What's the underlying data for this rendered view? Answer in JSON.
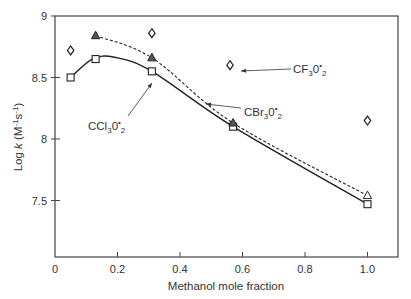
{
  "chart_data": {
    "type": "scatter",
    "title": "",
    "xlabel": "Methanol mole fraction",
    "ylabel": "Log k (M-1s-1)",
    "ylabel_parts": {
      "main": "Log ",
      "k": "k",
      "unit_open": " (M",
      "exp1": "-1",
      "mid": "s",
      "exp2": "-1",
      "unit_close": ")"
    },
    "xlim": [
      0,
      1.1
    ],
    "ylim": [
      7.04,
      9
    ],
    "xticks": [
      0,
      0.2,
      0.4,
      0.6,
      0.8,
      1.0
    ],
    "xtick_labels": [
      "0",
      "0.2",
      "0.4",
      "0.6",
      "0.8",
      "1.0"
    ],
    "yticks": [
      7.5,
      8,
      8.5,
      9
    ],
    "ytick_labels": [
      "7.5",
      "8",
      "8.5",
      "9"
    ],
    "grid": false,
    "legend": "inline annotations with arrows",
    "series": [
      {
        "name": "CCl3O2*",
        "label_main": "CCl",
        "label_sub": "3",
        "label_o": "0",
        "label_sup": "•",
        "label_sub2": "2",
        "marker": "open-square",
        "line": "solid",
        "x": [
          0.05,
          0.13,
          0.31,
          0.57,
          1.0
        ],
        "y": [
          8.5,
          8.65,
          8.55,
          8.1,
          7.47
        ]
      },
      {
        "name": "CBr3O2*",
        "label_main": "CBr",
        "label_sub": "3",
        "label_o": "0",
        "label_sup": "•",
        "label_sub2": "2",
        "marker": "triangle",
        "line": "dashed",
        "x": [
          0.13,
          0.31,
          0.57,
          1.0
        ],
        "y": [
          8.84,
          8.66,
          8.13,
          7.54
        ]
      },
      {
        "name": "CF3O2*",
        "label_main": "CF",
        "label_sub": "3",
        "label_o": "0",
        "label_sup": "•",
        "label_sub2": "2",
        "marker": "open-diamond",
        "line": "none",
        "x": [
          0.05,
          0.31,
          0.56,
          1.0
        ],
        "y": [
          8.72,
          8.86,
          8.6,
          8.15
        ]
      }
    ]
  }
}
